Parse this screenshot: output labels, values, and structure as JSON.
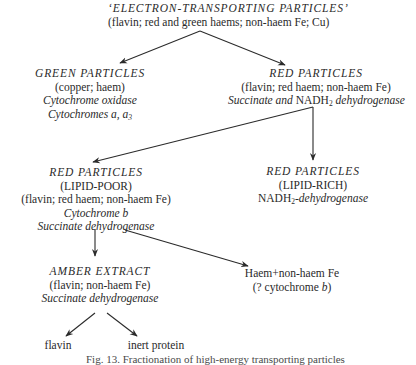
{
  "nodes": {
    "root": {
      "title": "‘ELECTRON-TRANSPORTING PARTICLES’",
      "components": "(flavin; red and green haems; non-haem Fe; Cu)"
    },
    "green_particles": {
      "title": "GREEN PARTICLES",
      "components": "(copper; haem)",
      "enzyme": "Cytochrome oxidase",
      "cytochromes_prefix": "Cytochromes ",
      "cytochromes_a": "a",
      "cytochromes_sep": ", ",
      "cytochromes_a3": "a",
      "cytochromes_a3_sub": "3"
    },
    "red_particles": {
      "title": "RED PARTICLES",
      "components": "(flavin; red haem; non-haem Fe)",
      "enzyme_prefix": "Succinate and ",
      "enzyme_nadh": "NADH",
      "enzyme_nadh_sub": "2",
      "enzyme_suffix": " dehydrogenase"
    },
    "red_lipid_poor": {
      "title": "RED PARTICLES",
      "subtitle": "(LIPID-POOR)",
      "components": "(flavin; red haem; non-haem Fe)",
      "cytochrome_prefix": "Cytochrome ",
      "cytochrome_b": "b",
      "enzyme": "Succinate dehydrogenase"
    },
    "red_lipid_rich": {
      "title": "RED PARTICLES",
      "subtitle": "(LIPID-RICH)",
      "enzyme_nadh": "NADH",
      "enzyme_nadh_sub": "2",
      "enzyme_suffix": "-dehydrogenase"
    },
    "amber_extract": {
      "title": "AMBER EXTRACT",
      "components": "(flavin; non-haem Fe)",
      "enzyme": "Succinate dehydrogenase"
    },
    "haem": {
      "line1": "Haem+non-haem Fe",
      "line2_prefix": "(? cytochrome ",
      "line2_b": "b",
      "line2_suffix": ")"
    },
    "flavin": {
      "label": "flavin"
    },
    "inert_protein": {
      "label": "inert protein"
    }
  },
  "edges": [
    {
      "from": "root",
      "to": "green_particles"
    },
    {
      "from": "root",
      "to": "red_particles"
    },
    {
      "from": "red_particles",
      "to": "red_lipid_poor"
    },
    {
      "from": "red_particles",
      "to": "red_lipid_rich"
    },
    {
      "from": "red_lipid_poor",
      "to": "amber_extract"
    },
    {
      "from": "red_lipid_poor",
      "to": "haem"
    },
    {
      "from": "amber_extract",
      "to": "flavin"
    },
    {
      "from": "amber_extract",
      "to": "inert_protein"
    }
  ],
  "caption": "Fig. 13. Fractionation of high-energy transporting particles"
}
